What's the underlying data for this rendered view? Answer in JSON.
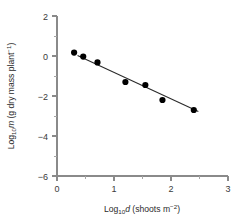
{
  "chart_data": {
    "type": "scatter",
    "title": "",
    "xlabel": "Log10d (shoots m-2)",
    "ylabel": "Log10m (g dry mass plant-1)",
    "xlabel_parts": {
      "lead": "Log",
      "sub": "10",
      "italic_var": "d",
      "tail_open": " (shoots m",
      "sup": "−2",
      "tail_close": ")"
    },
    "ylabel_parts": {
      "lead": "Log",
      "sub": "10",
      "italic_var": "m",
      "tail_open": " (g dry mass plant",
      "sup": "−1",
      "tail_close": ")"
    },
    "xlim": [
      0,
      3
    ],
    "ylim": [
      -6,
      2
    ],
    "xticks": [
      0,
      1,
      2,
      3
    ],
    "xticklabels": [
      "0",
      "1",
      "2",
      "3"
    ],
    "xminorticks": [
      0.5,
      1.5,
      2.5
    ],
    "yticks": [
      2,
      0,
      -2,
      -4,
      -6
    ],
    "yticklabels": [
      "2",
      "0",
      "−2",
      "−4",
      "−6"
    ],
    "yminorticks": [
      1,
      -1,
      -3,
      -5
    ],
    "grid": false,
    "legend": false,
    "marker": "filled-circle",
    "marker_color": "#000000",
    "line_color": "#2a2a2a",
    "axis_color": "#8a8a8a",
    "points": [
      {
        "x": 0.3,
        "y": 0.17
      },
      {
        "x": 0.46,
        "y": -0.03
      },
      {
        "x": 0.71,
        "y": -0.32
      },
      {
        "x": 1.2,
        "y": -1.3
      },
      {
        "x": 1.55,
        "y": -1.45
      },
      {
        "x": 1.85,
        "y": -2.2
      },
      {
        "x": 2.4,
        "y": -2.7
      }
    ],
    "fit_line": {
      "x_start": 0.36,
      "y_start": 0.02,
      "x_end": 2.48,
      "y_end": -2.77
    }
  }
}
